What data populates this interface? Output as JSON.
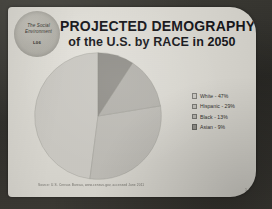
{
  "slide": {
    "logo": {
      "line1": "The Social",
      "line2": "Environment",
      "code": "L06"
    },
    "title": {
      "main": "PROJECTED DEMOGRAPHY",
      "sub": "of the U.S. by RACE in 2050"
    },
    "source_note": "Source: U.S. Census Bureau, www.census.gov, accessed June 2011",
    "corner_mark": "1"
  },
  "colors": {
    "frame": "#35342f",
    "slide_bg": "#d8d6cf",
    "title_text": "#16161a",
    "white_slice": "#c9c7c1",
    "hispanic_slice": "#bcbab4",
    "black_slice": "#b2b0aa",
    "asian_slice": "#8f8d87"
  },
  "chart_data": {
    "type": "pie",
    "title": "PROJECTED DEMOGRAPHY of the U.S. by RACE in 2050",
    "categories": [
      "White",
      "Hispanic",
      "Black",
      "Asian"
    ],
    "values": [
      47,
      29,
      13,
      9
    ],
    "unit": "%",
    "legend_position": "right",
    "legend_entries": [
      {
        "label": "White - 47%",
        "color": "#c9c7c1",
        "value": 47
      },
      {
        "label": "Hispanic - 29%",
        "color": "#bcbab4",
        "value": 29
      },
      {
        "label": "Black - 13%",
        "color": "#b2b0aa",
        "value": 13
      },
      {
        "label": "Asian - 9%",
        "color": "#8f8d87",
        "value": 9
      }
    ],
    "start_angle_deg": 0,
    "direction": "counterclockwise",
    "grid": false,
    "xlabel": "",
    "ylabel": ""
  }
}
